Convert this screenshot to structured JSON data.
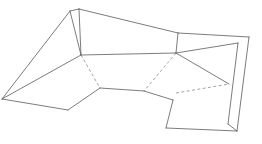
{
  "diagram": {
    "background_color": "#ffffff",
    "solid_edge_color": "#5a5a5a",
    "dashed_edge_color": "#8c8c8c",
    "face_fill_color": "#ffffff",
    "stroke_width": 0.8,
    "dash_pattern": "3 2.4",
    "canvas": {
      "width": 262,
      "height": 144
    },
    "vertices": {
      "apex_left": [
        70,
        11
      ],
      "apex_main": [
        79,
        9
      ],
      "left_tip": [
        2,
        99
      ],
      "ridge_node_left": [
        81,
        55
      ],
      "ridge_node_right": [
        176,
        53
      ],
      "top_right_corner": [
        178,
        33
      ],
      "right_panel_corner": [
        249,
        37
      ],
      "right_band_inner_top": [
        238,
        43
      ],
      "right_band_inner_mid": [
        229,
        84
      ],
      "right_band_inner_low": [
        228,
        124
      ],
      "right_band_bottom": [
        237,
        131
      ],
      "valley_left": [
        100,
        88
      ],
      "valley_right": [
        144,
        91
      ],
      "flap_top": [
        173,
        100
      ],
      "flap_bottom_left": [
        166,
        128
      ],
      "bottom_left_vertex": [
        68,
        110
      ],
      "dash_right_start": [
        176,
        93
      ]
    },
    "faces": [
      {
        "name": "upper-left-wing",
        "points": "79,9 81,55 2,99 70,11"
      },
      {
        "name": "lower-left-wing",
        "points": "81,55 100,88 68,110 2,99"
      },
      {
        "name": "top-ridge-band",
        "points": "79,9 178,33 176,53 81,55"
      },
      {
        "name": "center-valley-face",
        "points": "81,55 176,53 144,91 100,88"
      },
      {
        "name": "right-upper-panel",
        "points": "178,33 249,37 238,43 176,53"
      },
      {
        "name": "right-lower-panel",
        "points": "176,53 229,84 176,93 144,91"
      },
      {
        "name": "right-side-band",
        "points": "249,37 237,131 228,124 238,43"
      },
      {
        "name": "bottom-flap",
        "points": "176,93 229,84 237,131 166,128 173,100"
      }
    ],
    "solid_edges": [
      {
        "name": "apex-sliver-top",
        "d": "M 70 11 L 79 9"
      },
      {
        "name": "apex-left-to-ridge-node",
        "d": "M 70 11 L 81 55"
      },
      {
        "name": "apex-main-to-ridge-node",
        "d": "M 79 9 L 81 55"
      },
      {
        "name": "apex-left-to-left-tip",
        "d": "M 70 11 L 2 99"
      },
      {
        "name": "left-tip-to-ridge-node",
        "d": "M 2 99 L 81 55"
      },
      {
        "name": "left-tip-to-bottom-vertex",
        "d": "M 2 99 L 68 110"
      },
      {
        "name": "bottom-vertex-to-valley-left",
        "d": "M 68 110 L 100 88"
      },
      {
        "name": "top-ridge-upper",
        "d": "M 79 9 L 178 33"
      },
      {
        "name": "top-ridge-lower",
        "d": "M 81 55 L 176 53"
      },
      {
        "name": "right-panel-top",
        "d": "M 178 33 L 249 37"
      },
      {
        "name": "right-panel-left-riser",
        "d": "M 178 33 L 176 53"
      },
      {
        "name": "right-panel-inner-edge",
        "d": "M 238 43 L 176 53"
      },
      {
        "name": "right-band-outer",
        "d": "M 249 37 L 237 131"
      },
      {
        "name": "right-band-inner",
        "d": "M 238 43 L 228 124"
      },
      {
        "name": "right-band-bottom-close",
        "d": "M 228 124 L 237 131"
      },
      {
        "name": "valley-floor",
        "d": "M 100 88 L 144 91"
      },
      {
        "name": "valley-to-flap-top",
        "d": "M 144 91 L 173 100"
      },
      {
        "name": "ridge-node-right-to-band",
        "d": "M 176 53 L 229 84"
      },
      {
        "name": "flap-left-edge",
        "d": "M 173 100 L 166 128"
      },
      {
        "name": "flap-bottom-edge",
        "d": "M 166 128 L 237 131"
      }
    ],
    "dashed_edges": [
      {
        "name": "hidden-fold-left",
        "d": "M 81 55 L 100 88"
      },
      {
        "name": "hidden-fold-center",
        "d": "M 176 53 L 144 91"
      },
      {
        "name": "hidden-fold-right",
        "d": "M 176 93 L 229 84"
      }
    ]
  }
}
